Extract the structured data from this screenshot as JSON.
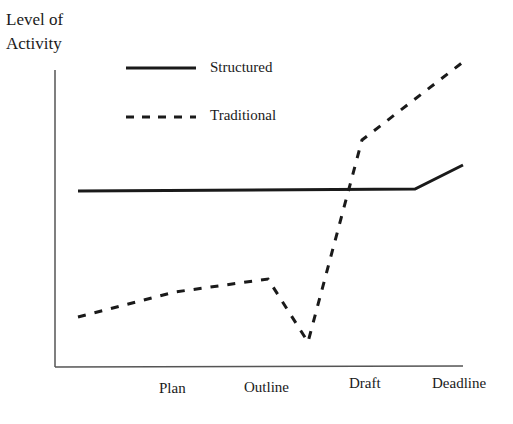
{
  "chart_data": {
    "type": "line",
    "title": "",
    "ylabel": "Level of Activity",
    "ylabel_lines": [
      "Level of",
      "Activity"
    ],
    "xlabel": "",
    "categories": [
      "Plan",
      "Outline",
      "Draft",
      "Deadline"
    ],
    "axis_ticks_numeric": false,
    "grid": false,
    "legend_position": "top-left inside",
    "series": [
      {
        "name": "Structured",
        "style": "solid",
        "color": "#1a1a1a",
        "points": [
          [
            78,
            191
          ],
          [
            415,
            189
          ],
          [
            463,
            165
          ]
        ]
      },
      {
        "name": "Traditional",
        "style": "dashed",
        "color": "#1a1a1a",
        "points": [
          [
            78,
            317
          ],
          [
            175,
            292
          ],
          [
            268,
            279
          ],
          [
            308,
            342
          ],
          [
            362,
            140
          ],
          [
            463,
            62
          ]
        ]
      }
    ]
  },
  "legend": {
    "structured": "Structured",
    "traditional": "Traditional"
  },
  "labels": {
    "y_line1": "Level of",
    "y_line2": "Activity",
    "x_plan": "Plan",
    "x_outline": "Outline",
    "x_draft": "Draft",
    "x_deadline": "Deadline"
  }
}
